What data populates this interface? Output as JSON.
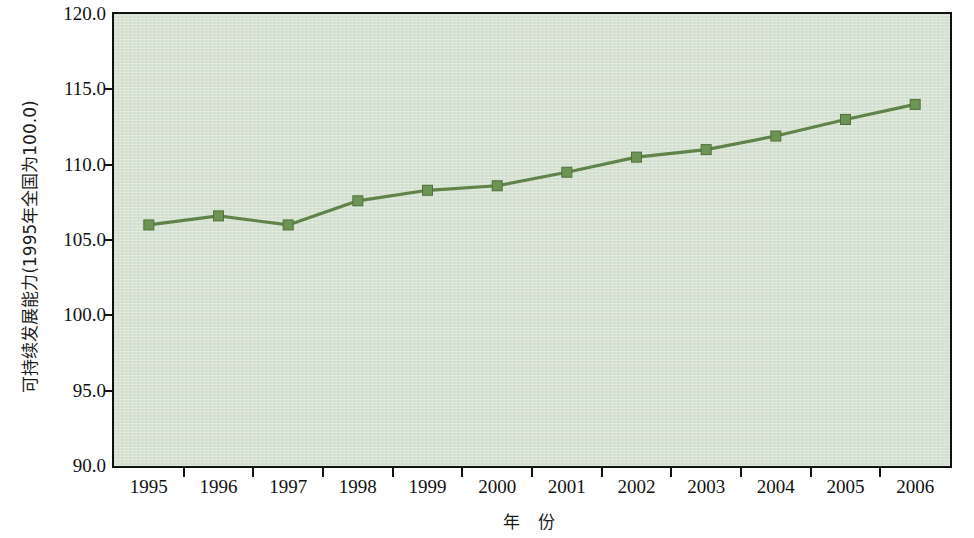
{
  "chart_data": {
    "type": "line",
    "title": "",
    "subtitle": "",
    "xlabel": "年 份",
    "ylabel": "可持续发展能力(1995年全国为100.0)",
    "categories": [
      "1995",
      "1996",
      "1997",
      "1998",
      "1999",
      "2000",
      "2001",
      "2002",
      "2003",
      "2004",
      "2005",
      "2006"
    ],
    "values": [
      106.0,
      106.6,
      106.0,
      107.6,
      108.3,
      108.6,
      109.5,
      110.5,
      111.0,
      111.9,
      113.0,
      114.0
    ],
    "series": [
      {
        "name": "可持续发展能力",
        "values": [
          106.0,
          106.6,
          106.0,
          107.6,
          108.3,
          108.6,
          109.5,
          110.5,
          111.0,
          111.9,
          113.0,
          114.0
        ]
      }
    ],
    "ylim": [
      90.0,
      120.0
    ],
    "ytick_values": [
      120.0,
      115.0,
      110.0,
      105.0,
      100.0,
      95.0,
      90.0
    ],
    "ytick_labels": [
      "120.0",
      "115.0",
      "110.0",
      "105.0",
      "100.0",
      "95.0",
      "90.0"
    ],
    "xtick_labels": [
      "1995",
      "1996",
      "1997",
      "1998",
      "1999",
      "2000",
      "2001",
      "2002",
      "2003",
      "2004",
      "2005",
      "2006"
    ],
    "grid": false,
    "legend": "none",
    "marker": "square",
    "colors": {
      "line": "#5f8348",
      "marker": "#6d9455",
      "marker_edge": "#4f7239",
      "plot_background": "#d6e2d2",
      "axis": "#111111",
      "text": "#111111"
    }
  }
}
